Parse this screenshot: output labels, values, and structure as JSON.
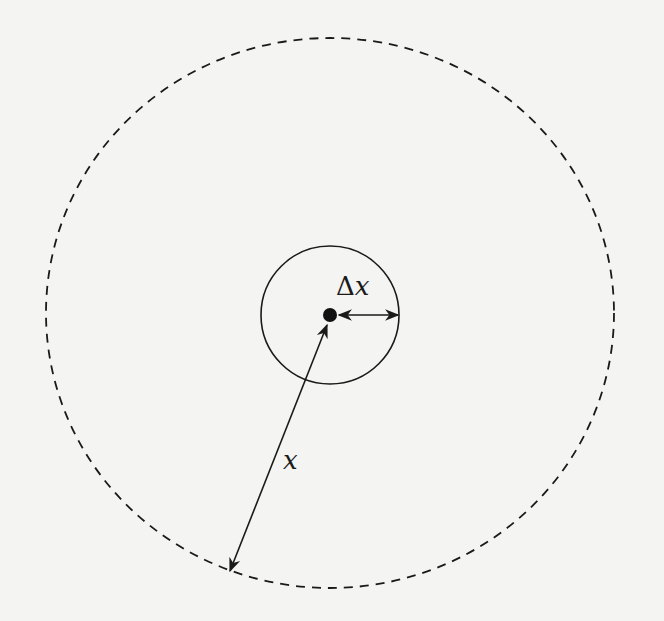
{
  "diagram": {
    "type": "concentric-circles",
    "colors": {
      "background": "#f4f4f2",
      "stroke": "#1a1a1a"
    },
    "outer_circle": {
      "style": "dashed",
      "cx": 330,
      "cy": 313,
      "rx": 284,
      "ry": 275
    },
    "inner_circle": {
      "style": "solid",
      "cx": 330,
      "cy": 315,
      "r": 69
    },
    "center_point": {
      "cx": 330,
      "cy": 315,
      "r": 7
    },
    "labels": {
      "delta_symbol": "Δ",
      "delta_var": "x",
      "radius_var": "x"
    },
    "arrows": [
      {
        "name": "delta-x-arrow",
        "from": [
          338,
          315
        ],
        "to": [
          399,
          315
        ],
        "double_headed": true
      },
      {
        "name": "x-arrow",
        "from": [
          326,
          324
        ],
        "to": [
          229,
          572
        ],
        "double_headed": true
      }
    ]
  }
}
